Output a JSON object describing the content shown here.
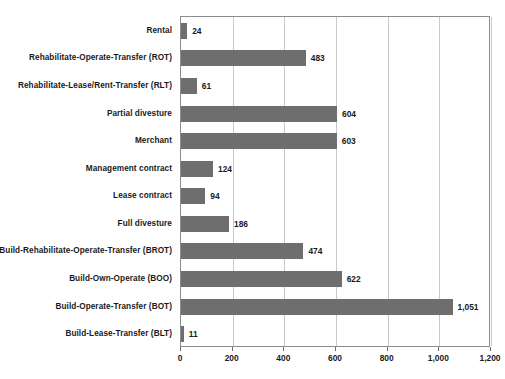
{
  "chart_data": {
    "type": "bar",
    "orientation": "horizontal",
    "title": "",
    "subtitle": "",
    "xlabel": "",
    "ylabel": "",
    "xlim": [
      0,
      1200
    ],
    "xticks": [
      0,
      200,
      400,
      600,
      800,
      1000,
      1200
    ],
    "xtick_labels": [
      "0",
      "200",
      "400",
      "600",
      "800",
      "1,000",
      "1,200"
    ],
    "grid": true,
    "grid_axis": "x",
    "legend": false,
    "legend_position": "none",
    "bar_color": "#6e6e6e",
    "grid_color": "#c9c9c9",
    "frame_color": "#8c8c8c",
    "text_color": "#1a1a1a",
    "background_color": "#ffffff",
    "data_labels": true,
    "categories": [
      "Rental",
      "Rehabilitate-Operate-Transfer (ROT)",
      "Rehabilitate-Lease/Rent-Transfer (RLT)",
      "Partial divesture",
      "Merchant",
      "Management contract",
      "Lease contract",
      "Full divesture",
      "Build-Rehabilitate-Operate-Transfer (BROT)",
      "Build-Own-Operate (BOO)",
      "Build-Operate-Transfer (BOT)",
      "Build-Lease-Transfer (BLT)"
    ],
    "values": [
      24,
      483,
      61,
      604,
      603,
      124,
      94,
      186,
      474,
      622,
      1051,
      11
    ],
    "value_labels": [
      "24",
      "483",
      "61",
      "604",
      "603",
      "124",
      "94",
      "186",
      "474",
      "622",
      "1,051",
      "11"
    ]
  }
}
